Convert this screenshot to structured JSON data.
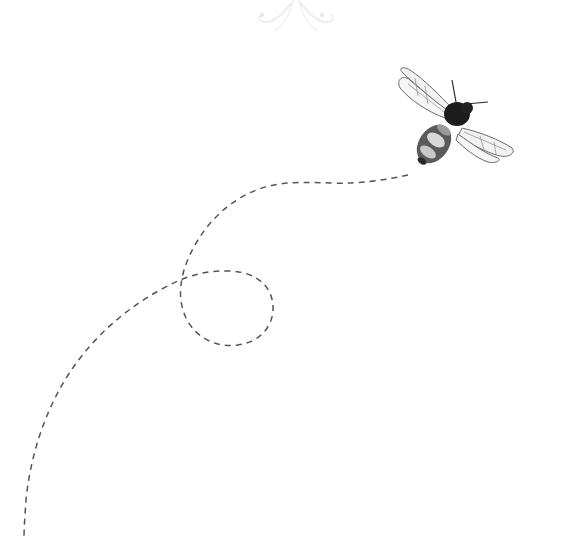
{
  "illustration": {
    "subject": "bee",
    "flight_path_style": "dashed",
    "colors": {
      "background": "#ffffff",
      "path": "#555555",
      "ornament": "#e6e6e6",
      "bee_body_dark": "#1c1c1c",
      "bee_body_mid": "#6e6e6e",
      "bee_body_light": "#d8d8d8",
      "wing_fill": "#f4f4f4",
      "wing_stroke": "#6a6a6a"
    }
  },
  "ornament": {
    "icon": "flourish-icon"
  },
  "bee": {
    "icon": "bee-icon"
  }
}
